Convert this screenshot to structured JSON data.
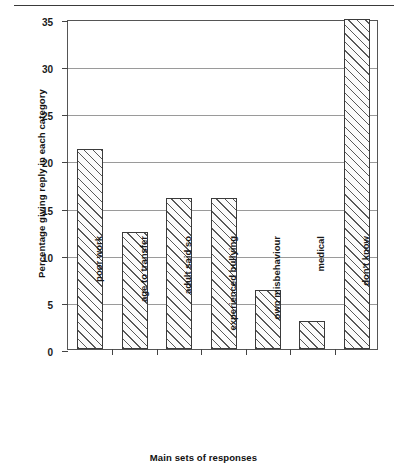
{
  "chart_data": {
    "type": "bar",
    "title": "",
    "subtitle": "",
    "xlabel": "Main sets of responses",
    "ylabel": "Percentage giving reply in each category",
    "categories": [
      "poor work",
      "age to transfer",
      "adult said so",
      "experienced bullying",
      "own misbehaviour",
      "medical",
      "don't know"
    ],
    "values": [
      21.2,
      12.4,
      16.0,
      16.0,
      6.3,
      3.0,
      35.0
    ],
    "ylim": [
      0,
      35
    ],
    "yticks": [
      0,
      5,
      10,
      15,
      20,
      25,
      30,
      35
    ],
    "ytick_labels": [
      "0",
      "5",
      "10",
      "15",
      "20",
      "25",
      "30",
      "35"
    ],
    "grid": true,
    "grid_axis": "y",
    "legend": false,
    "legend_position": "none",
    "bar_fill": "diagonal-hatch",
    "bar_edge_color": "#3b3b3b",
    "bar_face_color": "#fbfbfb",
    "grid_color": "#9a9a9a",
    "axis_color": "#555555"
  }
}
